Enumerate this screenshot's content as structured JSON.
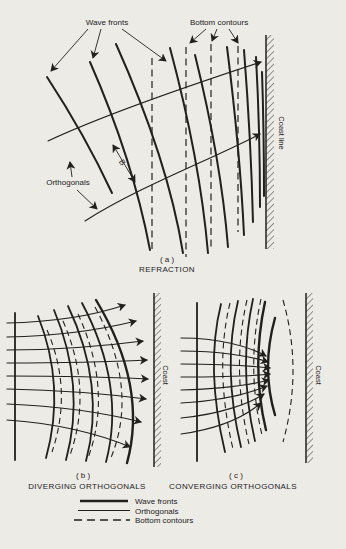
{
  "colors": {
    "paper": "#edebe6",
    "ink": "#22201c"
  },
  "panel_a": {
    "id_label": "( a )",
    "title": "REFRACTION",
    "wave_fronts_label": "Wave fronts",
    "bottom_contours_label": "Bottom contours",
    "orthogonals_label": "Orthogonals",
    "coast_label": "Coast line",
    "spacing_label": "B"
  },
  "panel_b": {
    "id_label": "( b )",
    "title": "DIVERGING ORTHOGONALS",
    "coast_label": "Coast"
  },
  "panel_c": {
    "id_label": "( c )",
    "title": "CONVERGING ORTHOGONALS",
    "coast_label": "Coast"
  },
  "legend": {
    "items": [
      {
        "key": "wave-fronts",
        "label": "Wave fronts"
      },
      {
        "key": "orthogonals",
        "label": "Orthogonals"
      },
      {
        "key": "bottom-contours",
        "label": "Bottom contours"
      }
    ]
  }
}
